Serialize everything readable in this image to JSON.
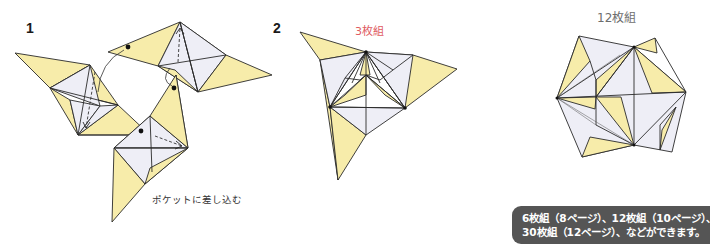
{
  "steps": [
    {
      "number": "1",
      "annotation": "ポケットに差し込む",
      "diagram": "three-units-being-joined"
    },
    {
      "number": "2",
      "label": "3枚組",
      "diagram": "three-unit-assembly"
    }
  ],
  "result": {
    "label": "12枚組",
    "diagram": "twelve-unit-assembly"
  },
  "caption": {
    "lines": [
      "6枚組（8ページ）、12枚組（10ページ）、",
      "30枚組（12ページ）、などができます。"
    ]
  },
  "colors": {
    "paper_front": "#f7ecaa",
    "paper_back": "#eeeef6",
    "outline": "#2a2a2a",
    "label_accent": "#e05a62",
    "caption_bg": "#555555",
    "caption_text": "#ffffff"
  }
}
